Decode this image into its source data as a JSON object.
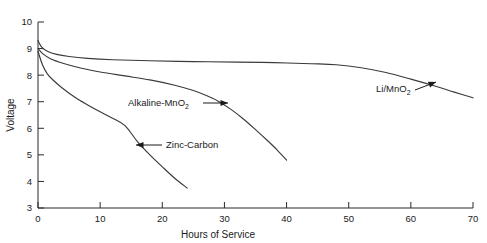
{
  "chart_data": {
    "type": "line",
    "title": "",
    "xlabel": "Hours of Service",
    "ylabel": "Voltage",
    "xlim": [
      0,
      70
    ],
    "ylim": [
      3,
      10
    ],
    "xticks": [
      0,
      10,
      20,
      30,
      40,
      50,
      60,
      70
    ],
    "yticks": [
      3,
      4,
      5,
      6,
      7,
      8,
      9,
      10
    ],
    "xtick_labels": [
      "0",
      "10",
      "20",
      "30",
      "40",
      "50",
      "60",
      "70"
    ],
    "ytick_labels": [
      "3",
      "4",
      "5",
      "6",
      "7",
      "8",
      "9",
      "10"
    ],
    "grid": false,
    "legend": "annotations",
    "series": [
      {
        "name": "Li/MnO2",
        "label": "Li/MnO",
        "label_sub": "2",
        "color": "#3a3a3a",
        "points": [
          [
            0.0,
            9.3
          ],
          [
            0.6,
            9.05
          ],
          [
            1.5,
            8.9
          ],
          [
            3.0,
            8.78
          ],
          [
            5.0,
            8.7
          ],
          [
            8.0,
            8.63
          ],
          [
            12.0,
            8.58
          ],
          [
            18.0,
            8.54
          ],
          [
            25.0,
            8.51
          ],
          [
            32.0,
            8.49
          ],
          [
            38.0,
            8.47
          ],
          [
            44.0,
            8.43
          ],
          [
            48.0,
            8.39
          ],
          [
            52.0,
            8.28
          ],
          [
            56.0,
            8.1
          ],
          [
            60.0,
            7.85
          ],
          [
            64.0,
            7.58
          ],
          [
            67.0,
            7.36
          ],
          [
            70.0,
            7.15
          ]
        ]
      },
      {
        "name": "Alkaline-MnO2",
        "label": "Alkaline-MnO",
        "label_sub": "2",
        "color": "#3a3a3a",
        "points": [
          [
            0.0,
            9.0
          ],
          [
            0.8,
            8.8
          ],
          [
            2.0,
            8.62
          ],
          [
            4.0,
            8.45
          ],
          [
            7.0,
            8.26
          ],
          [
            10.0,
            8.12
          ],
          [
            14.0,
            7.97
          ],
          [
            18.0,
            7.82
          ],
          [
            22.0,
            7.62
          ],
          [
            25.0,
            7.42
          ],
          [
            27.0,
            7.24
          ],
          [
            29.0,
            7.02
          ],
          [
            31.0,
            6.72
          ],
          [
            33.0,
            6.36
          ],
          [
            35.0,
            5.95
          ],
          [
            37.0,
            5.52
          ],
          [
            38.5,
            5.18
          ],
          [
            40.0,
            4.8
          ]
        ]
      },
      {
        "name": "Zinc-Carbon",
        "label": "Zinc-Carbon",
        "label_sub": "",
        "color": "#3a3a3a",
        "points": [
          [
            0.0,
            8.9
          ],
          [
            0.7,
            8.4
          ],
          [
            1.5,
            8.05
          ],
          [
            2.5,
            7.8
          ],
          [
            4.0,
            7.5
          ],
          [
            6.0,
            7.16
          ],
          [
            8.0,
            6.88
          ],
          [
            10.0,
            6.62
          ],
          [
            12.0,
            6.38
          ],
          [
            14.0,
            6.1
          ],
          [
            16.0,
            5.5
          ],
          [
            18.0,
            5.0
          ],
          [
            20.0,
            4.55
          ],
          [
            22.0,
            4.12
          ],
          [
            24.0,
            3.75
          ]
        ]
      }
    ],
    "annotations": [
      {
        "name": "alkaline-mno2",
        "text": "Alkaline-MnO",
        "sub": "2",
        "text_x": 128,
        "text_y": 106,
        "arrow_from_x": 203,
        "arrow_from_y": 103,
        "arrow_to_x": 228,
        "arrow_to_y": 103,
        "direction": "right"
      },
      {
        "name": "zinc-carbon",
        "text": "Zinc-Carbon",
        "sub": "",
        "text_x": 166,
        "text_y": 148,
        "arrow_from_x": 162,
        "arrow_from_y": 145,
        "arrow_to_x": 136,
        "arrow_to_y": 145,
        "direction": "left"
      },
      {
        "name": "li-mno2",
        "text": "Li/MnO",
        "sub": "2",
        "text_x": 376,
        "text_y": 92,
        "arrow_from_x": 415,
        "arrow_from_y": 90,
        "arrow_to_x": 436,
        "arrow_to_y": 82,
        "direction": "upright"
      }
    ]
  }
}
